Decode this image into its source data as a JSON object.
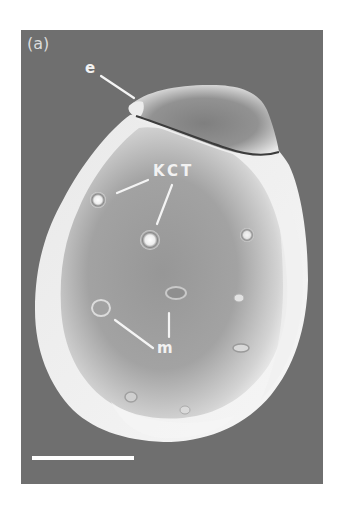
{
  "figure": {
    "panel_label": "(a)",
    "annotations": {
      "eggshell_cap": "e",
      "kct": "KCT",
      "micropyle": "m"
    },
    "scale_bar": {
      "visible": true,
      "color": "#ffffff"
    },
    "colors": {
      "background": "#6f6f6f",
      "specimen_highlight": "#f4f4f4",
      "specimen_shade": "#8a8a8a",
      "label": "#f2f2f2"
    }
  }
}
